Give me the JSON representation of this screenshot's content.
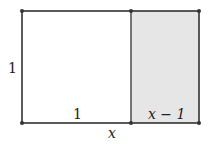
{
  "diagram": {
    "type": "rectangle-partition",
    "colors": {
      "stroke": "#333333",
      "shaded_fill": "#e6e6e6",
      "background": "#ffffff"
    },
    "labels": {
      "left_side": "1",
      "bottom_left_segment": "1",
      "bottom_right_segment": "x − 1",
      "total_width": "x"
    }
  }
}
